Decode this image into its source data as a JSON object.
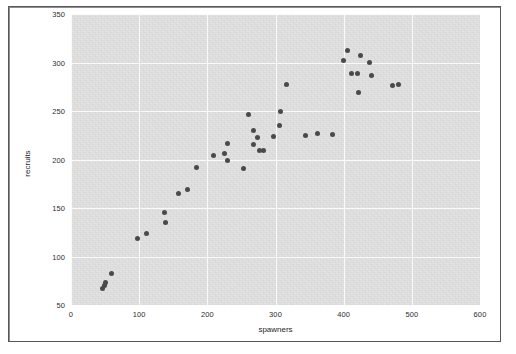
{
  "figure": {
    "background_color": "#ffffff",
    "panel_color": "#e2e2e2",
    "grid_color": "#fafafa",
    "point_color": "#4a4a4a",
    "frame_color": "#58585c"
  },
  "chart_data": {
    "type": "scatter",
    "title": "",
    "xlabel": "spawners",
    "ylabel": "recruits",
    "xlim": [
      0,
      600
    ],
    "ylim": [
      50,
      350
    ],
    "xticks": [
      0,
      100,
      200,
      300,
      400,
      500,
      600
    ],
    "yticks": [
      50,
      100,
      150,
      200,
      250,
      300,
      350
    ],
    "xtick_labels": [
      "0",
      "100",
      "200",
      "300",
      "400",
      "500",
      "600"
    ],
    "ytick_labels": [
      "50",
      "100",
      "150",
      "200",
      "250",
      "300",
      "350"
    ],
    "grid": true,
    "legend": false,
    "marker": "circle",
    "marker_size": 5,
    "n_points": 39,
    "series": [
      {
        "name": "spawners-recruits",
        "points": [
          [
            46,
            67
          ],
          [
            49,
            70
          ],
          [
            50,
            73
          ],
          [
            59,
            82
          ],
          [
            98,
            119
          ],
          [
            111,
            124
          ],
          [
            137,
            145
          ],
          [
            139,
            135
          ],
          [
            158,
            165
          ],
          [
            171,
            169
          ],
          [
            184,
            192
          ],
          [
            209,
            204
          ],
          [
            225,
            206
          ],
          [
            229,
            199
          ],
          [
            230,
            216
          ],
          [
            253,
            191
          ],
          [
            260,
            246
          ],
          [
            267,
            230
          ],
          [
            267,
            215
          ],
          [
            274,
            223
          ],
          [
            277,
            209
          ],
          [
            282,
            209
          ],
          [
            297,
            224
          ],
          [
            306,
            235
          ],
          [
            307,
            250
          ],
          [
            316,
            277
          ],
          [
            344,
            225
          ],
          [
            361,
            227
          ],
          [
            383,
            226
          ],
          [
            400,
            302
          ],
          [
            406,
            312
          ],
          [
            412,
            289
          ],
          [
            421,
            289
          ],
          [
            422,
            269
          ],
          [
            424,
            307
          ],
          [
            438,
            300
          ],
          [
            441,
            287
          ],
          [
            471,
            276
          ],
          [
            480,
            277
          ]
        ]
      }
    ]
  }
}
